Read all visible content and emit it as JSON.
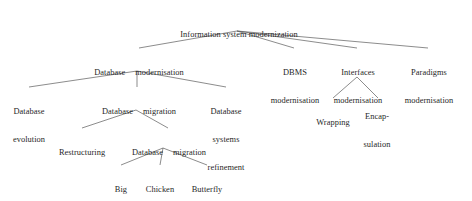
{
  "diagram": {
    "type": "hierarchy-tree",
    "line_color": "#5a5a5a",
    "text_color": "#1f1f1f",
    "background": "#ffffff",
    "nodes": {
      "root": {
        "label": "Information system modernization"
      },
      "database_modernisation": {
        "line1": "Database",
        "line2": "modernisation"
      },
      "dbms_modernisation": {
        "line1": "DBMS",
        "line2": "modernisation"
      },
      "interfaces_modernisation": {
        "line1": "Interfaces",
        "line2": "modernisation"
      },
      "paradigms_modernisation": {
        "line1": "Paradigms",
        "line2": "modernisation"
      },
      "database_evolution": {
        "line1": "Database",
        "line2": "evolution"
      },
      "database_migration_l3": {
        "line1": "Database",
        "line2": "migration"
      },
      "database_systems_refinement": {
        "line1": "Database",
        "line2": "systems",
        "line3": "refinement"
      },
      "wrapping": {
        "line1": "Wrapping"
      },
      "encapsulation": {
        "line1": "Encap-",
        "line2": "sulation"
      },
      "restructuring": {
        "line1": "Restructuring"
      },
      "database_migration_l4": {
        "line1": "Database",
        "line2": "migration"
      },
      "big_bang": {
        "line1": "Big",
        "line2": "bang"
      },
      "chicken_little": {
        "line1": "Chicken",
        "line2": "little"
      },
      "butterfly": {
        "line1": "Butterfly"
      }
    },
    "edges": [
      {
        "from": "root",
        "to": "database_modernisation"
      },
      {
        "from": "root",
        "to": "dbms_modernisation"
      },
      {
        "from": "root",
        "to": "interfaces_modernisation"
      },
      {
        "from": "root",
        "to": "paradigms_modernisation"
      },
      {
        "from": "database_modernisation",
        "to": "database_evolution"
      },
      {
        "from": "database_modernisation",
        "to": "database_migration_l3"
      },
      {
        "from": "database_modernisation",
        "to": "database_systems_refinement"
      },
      {
        "from": "interfaces_modernisation",
        "to": "wrapping"
      },
      {
        "from": "interfaces_modernisation",
        "to": "encapsulation"
      },
      {
        "from": "database_migration_l3",
        "to": "restructuring"
      },
      {
        "from": "database_migration_l3",
        "to": "database_migration_l4"
      },
      {
        "from": "database_migration_l4",
        "to": "big_bang"
      },
      {
        "from": "database_migration_l4",
        "to": "chicken_little"
      },
      {
        "from": "database_migration_l4",
        "to": "butterfly"
      }
    ]
  }
}
